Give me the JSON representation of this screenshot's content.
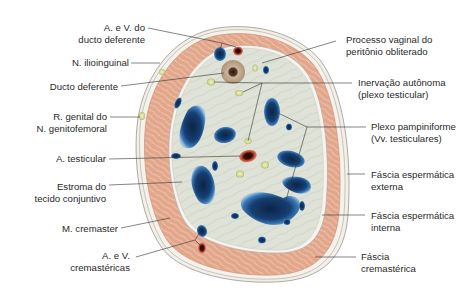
{
  "figure": {
    "labels_left": [
      {
        "id": "a-v-ducto-deferente",
        "lines": [
          "A. e V. do",
          "ducto deferente"
        ]
      },
      {
        "id": "n-ilioinguinal",
        "lines": [
          "N. ilioinguinal"
        ]
      },
      {
        "id": "ducto-deferente",
        "lines": [
          "Ducto deferente"
        ]
      },
      {
        "id": "r-genital",
        "lines": [
          "R. genital do",
          "N. genitofemoral"
        ]
      },
      {
        "id": "a-testicular",
        "lines": [
          "A. testicular"
        ]
      },
      {
        "id": "estroma",
        "lines": [
          "Estroma do",
          "tecido conjuntivo"
        ]
      },
      {
        "id": "m-cremaster",
        "lines": [
          "M. cremaster"
        ]
      },
      {
        "id": "a-v-cremastericas",
        "lines": [
          "A. e V.",
          "cremastéricas"
        ]
      }
    ],
    "labels_right": [
      {
        "id": "processo-vaginal",
        "lines": [
          "Processo vaginal do",
          "peritônio obliterado"
        ]
      },
      {
        "id": "inervacao-autonoma",
        "lines": [
          "Inervação autônoma",
          "(plexo testicular)"
        ]
      },
      {
        "id": "plexo-pampiniforme",
        "lines": [
          "Plexo pampiniforme",
          "(Vv. testiculares)"
        ]
      },
      {
        "id": "fascia-esp-externa",
        "lines": [
          "Fáscia espermática",
          "externa"
        ]
      },
      {
        "id": "fascia-esp-interna",
        "lines": [
          "Fáscia espermática",
          "interna"
        ]
      },
      {
        "id": "fascia-cremasterica",
        "lines": [
          "Fáscia",
          "cremastérica"
        ]
      }
    ],
    "colors": {
      "muscle": "#e3a98c",
      "stroma": "#dcdfd3",
      "vein": "#1f4f86",
      "vein_dark": "#0d2a4f",
      "artery": "#b2321f",
      "nerve": "#d9df9a",
      "fascia": "#f1ece4",
      "duct": "#c9b39b"
    }
  }
}
